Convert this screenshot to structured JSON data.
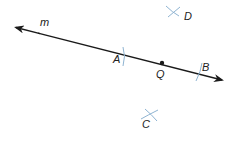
{
  "diagram": {
    "line": {
      "label": "m"
    },
    "points": {
      "A": {
        "label": "A"
      },
      "B": {
        "label": "B"
      },
      "Q": {
        "label": "Q"
      },
      "C": {
        "label": "C"
      },
      "D": {
        "label": "D"
      }
    },
    "colors": {
      "line": "#1a1a1a",
      "construction_arcs": "#8fb4d2"
    }
  }
}
